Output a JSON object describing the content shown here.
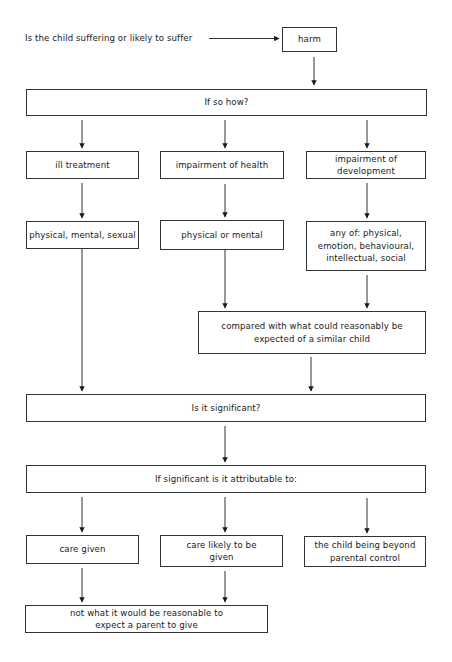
{
  "diagram": {
    "question": "Is the child suffering or likely to suffer",
    "nodes": {
      "harm": "harm",
      "if_so_how": "If so how?",
      "ill_treatment": "ill treatment",
      "impairment_health": "impairment of health",
      "impairment_development": "impairment of development",
      "ill_treatment_types": "physical, mental, sexual",
      "health_types": "physical or mental",
      "development_types": "any of: physical, emotion, behavioural, intellectual, social",
      "compared_with": "compared with what could reasonably be expected of a similar child",
      "is_significant": "Is it significant?",
      "attributable": "If significant is it attributable to:",
      "care_given": "care given",
      "care_likely": "care likely to be given",
      "beyond_control": "the child being beyond parental control",
      "not_reasonable": "not what it would be reasonable to expect a parent to give"
    },
    "edges": [
      [
        "question",
        "harm"
      ],
      [
        "harm",
        "if_so_how"
      ],
      [
        "if_so_how",
        "ill_treatment"
      ],
      [
        "if_so_how",
        "impairment_health"
      ],
      [
        "if_so_how",
        "impairment_development"
      ],
      [
        "ill_treatment",
        "ill_treatment_types"
      ],
      [
        "impairment_health",
        "health_types"
      ],
      [
        "impairment_development",
        "development_types"
      ],
      [
        "health_types",
        "compared_with"
      ],
      [
        "development_types",
        "compared_with"
      ],
      [
        "ill_treatment_types",
        "is_significant"
      ],
      [
        "compared_with",
        "is_significant"
      ],
      [
        "is_significant",
        "attributable"
      ],
      [
        "attributable",
        "care_given"
      ],
      [
        "attributable",
        "care_likely"
      ],
      [
        "attributable",
        "beyond_control"
      ],
      [
        "care_given",
        "not_reasonable"
      ],
      [
        "care_likely",
        "not_reasonable"
      ]
    ],
    "colors": {
      "line": "#1a1a1a",
      "border": "#333333",
      "background": "#ffffff"
    }
  }
}
